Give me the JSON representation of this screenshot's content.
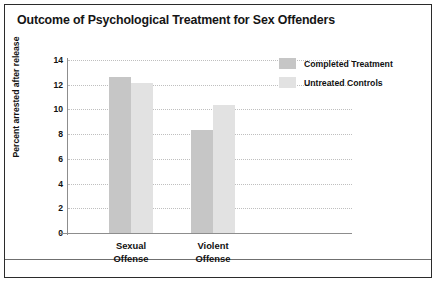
{
  "figure": {
    "title": "Outcome of Psychological Treatment for Sex Offenders"
  },
  "legend": {
    "items": [
      {
        "label": "Completed Treatment",
        "color": "#c6c6c6",
        "swatch_name": "legend-swatch-completed-treatment"
      },
      {
        "label": "Untreated Controls",
        "color": "#e2e2e2",
        "swatch_name": "legend-swatch-untreated-controls"
      }
    ]
  },
  "axes": {
    "ylabel": "Percent arrested after release",
    "yticks": [
      "0",
      "2",
      "4",
      "6",
      "8",
      "10",
      "12",
      "14"
    ],
    "xcategories": [
      {
        "line1": "Sexual",
        "line2": "Offense"
      },
      {
        "line1": "Violent",
        "line2": "Offense"
      }
    ]
  },
  "chart_data": {
    "type": "bar",
    "title": "Outcome of Psychological Treatment for Sex Offenders",
    "xlabel": "",
    "ylabel": "Percent arrested after release",
    "categories": [
      "Sexual Offense",
      "Violent Offense"
    ],
    "series": [
      {
        "name": "Completed Treatment",
        "color": "#c6c6c6",
        "values": [
          12.6,
          8.3
        ]
      },
      {
        "name": "Untreated Controls",
        "color": "#e2e2e2",
        "values": [
          12.1,
          10.4
        ]
      }
    ],
    "ylim": [
      0,
      14
    ],
    "ytick_step": 2,
    "yticks": [
      0,
      2,
      4,
      6,
      8,
      10,
      12,
      14
    ],
    "grid": "horizontal-dotted",
    "legend_position": "top-right-outside"
  }
}
